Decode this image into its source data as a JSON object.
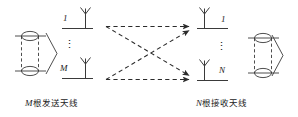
{
  "figure": {
    "type": "mimo-block-diagram",
    "background_color": "#ffffff",
    "stroke_color": "#333333"
  },
  "transmitter": {
    "antenna_labels": [
      "1",
      "M"
    ],
    "ellipsis": "⋮",
    "caption_var": "M",
    "caption_text": "根发送天线",
    "caption_full": "M根发送天线",
    "block_name": "encoder-cylinder"
  },
  "receiver": {
    "antenna_labels": [
      "1",
      "N"
    ],
    "ellipsis": "⋮",
    "caption_var": "N",
    "caption_text": "根接收天线",
    "caption_full": "N根接收天线",
    "block_name": "decoder-cylinder"
  },
  "channel": {
    "path_count": 4,
    "line_style": "dashed",
    "arrow_direction": "right",
    "paths": [
      {
        "name": "tx1-to-rx1",
        "from": "tx-antenna-1",
        "to": "rx-antenna-1"
      },
      {
        "name": "tx1-to-rxN",
        "from": "tx-antenna-1",
        "to": "rx-antenna-N"
      },
      {
        "name": "txM-to-rx1",
        "from": "tx-antenna-M",
        "to": "rx-antenna-1"
      },
      {
        "name": "txM-to-rxN",
        "from": "tx-antenna-M",
        "to": "rx-antenna-N"
      }
    ]
  }
}
